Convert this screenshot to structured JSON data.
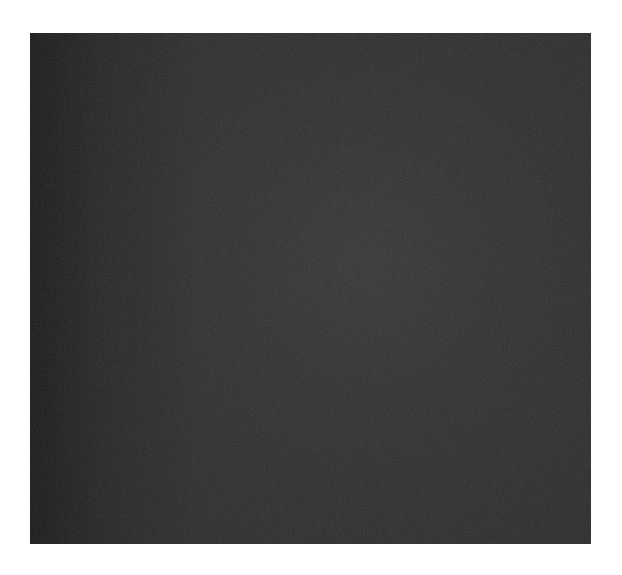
{
  "image": {
    "description": "Dark grainy textured photograph square on white background",
    "colors": {
      "background": "#ffffff",
      "texture_base": "#2a2a2a",
      "texture_dark_edge": "#141414"
    }
  }
}
